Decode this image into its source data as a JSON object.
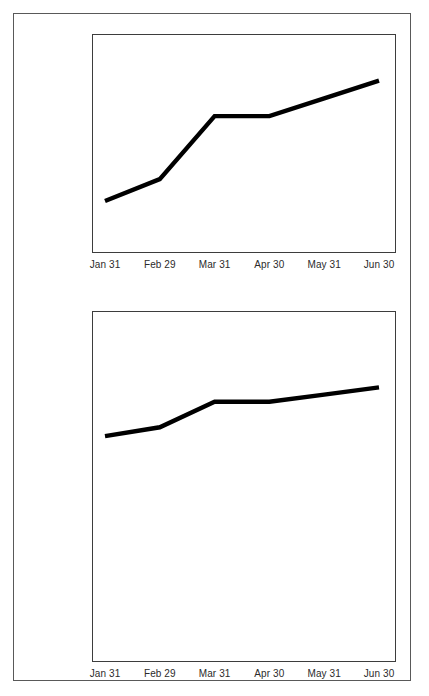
{
  "page": {
    "background_color": "#ffffff",
    "border_color": "#595959",
    "line_color": "#000000",
    "axis_color": "#3d3d3d",
    "text_color": "#2b2b2b"
  },
  "charts": [
    {
      "name": "truncated-axis-chart",
      "ylabels": [
        "$260,000",
        "$250,000",
        "$240,000",
        "$230,000",
        "$220,000",
        "$210,000",
        "$200,000",
        "$190,000"
      ],
      "xlabels": [
        "Jan 31",
        "Feb 29",
        "Mar 31",
        "Apr 30",
        "May 31",
        "Jun 30"
      ]
    },
    {
      "name": "zero-based-axis-chart",
      "ylabels": [
        "$300,000",
        "$250,000",
        "$200,000",
        "$150,000",
        "$100,000",
        "$  50,000",
        "$          0"
      ],
      "xlabels": [
        "Jan 31",
        "Feb 29",
        "Mar 31",
        "Apr 30",
        "May 31",
        "Jun 30"
      ]
    }
  ],
  "chart_data": [
    {
      "type": "line",
      "name": "truncated-axis-chart",
      "title": "",
      "xlabel": "",
      "ylabel": "",
      "categories": [
        "Jan 31",
        "Feb 29",
        "Mar 31",
        "Apr 30",
        "May 31",
        "Jun 30"
      ],
      "series": [
        {
          "name": "Value",
          "values": [
            204000,
            212000,
            235000,
            235000,
            241500,
            248000
          ]
        }
      ],
      "ylim": [
        185000,
        265000
      ],
      "yticks": [
        190000,
        200000,
        210000,
        220000,
        230000,
        240000,
        250000,
        260000
      ],
      "ytick_labels": [
        "$190,000",
        "$200,000",
        "$210,000",
        "$220,000",
        "$230,000",
        "$240,000",
        "$250,000",
        "$260,000"
      ],
      "grid": false,
      "legend": "none"
    },
    {
      "type": "line",
      "name": "zero-based-axis-chart",
      "title": "",
      "xlabel": "",
      "ylabel": "",
      "categories": [
        "Jan 31",
        "Feb 29",
        "Mar 31",
        "Apr 30",
        "May 31",
        "Jun 30"
      ],
      "series": [
        {
          "name": "Value",
          "values": [
            204000,
            212000,
            235000,
            235000,
            241500,
            248000
          ]
        }
      ],
      "ylim": [
        0,
        317000
      ],
      "yticks": [
        0,
        50000,
        100000,
        150000,
        200000,
        250000,
        300000
      ],
      "ytick_labels": [
        "$          0",
        "$  50,000",
        "$100,000",
        "$150,000",
        "$200,000",
        "$250,000",
        "$300,000"
      ],
      "grid": false,
      "legend": "none"
    }
  ]
}
